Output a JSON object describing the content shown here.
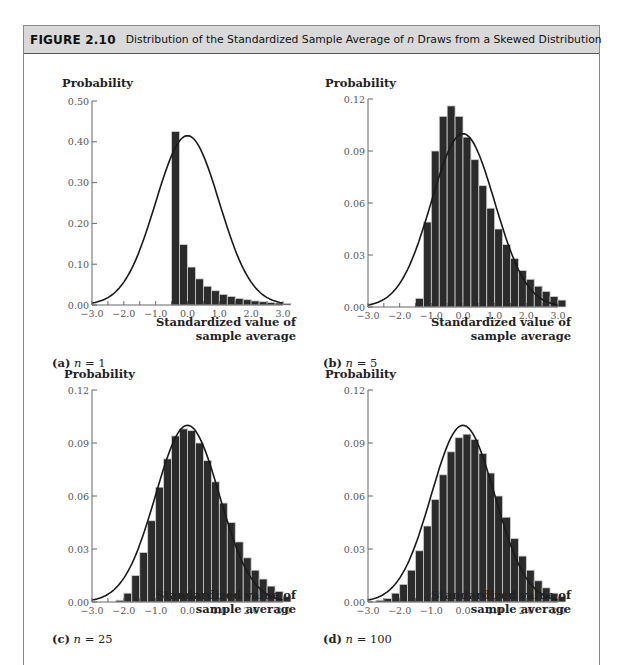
{
  "figure": {
    "number": "FIGURE 2.10",
    "title_pre": "Distribution of the Standardized Sample Average of ",
    "title_var": "n",
    "title_post": " Draws from a Skewed Distribution"
  },
  "colors": {
    "header_bg": "#d9d9d9",
    "bar": "#2b2b2b",
    "bar_edge": "#cfcfcf",
    "curve": "#1a1a1a",
    "axis": "#666666"
  },
  "chart_data": [
    {
      "id": "a",
      "type": "bar",
      "title": "(a) n = 1",
      "caption_letter": "(a)",
      "caption_var": "n",
      "caption_value": "= 1",
      "xlabel": "Standardized value of sample average",
      "xlabel_line1": "Standardized value of",
      "xlabel_line2": "sample average",
      "ylabel": "Probability",
      "xlim": [
        -3.0,
        3.0
      ],
      "ylim": [
        0.0,
        0.5
      ],
      "xticks": [
        "-3.0",
        "-2.0",
        "-1.0",
        "0.0",
        "1.0",
        "2.0",
        "3.0"
      ],
      "yticks": [
        "0.00",
        "0.10",
        "0.20",
        "0.30",
        "0.40",
        "0.50"
      ],
      "ytick_values": [
        0.0,
        0.1,
        0.2,
        0.3,
        0.4,
        0.5
      ],
      "bin_width": 0.25,
      "bin_start": -0.5,
      "values": [
        0.425,
        0.148,
        0.093,
        0.064,
        0.046,
        0.035,
        0.026,
        0.021,
        0.016,
        0.013,
        0.01,
        0.008,
        0.006,
        0.005,
        0.004
      ],
      "overlay": {
        "type": "normal-density",
        "peak": 0.415,
        "mean": 0.0,
        "sd": 1.0
      }
    },
    {
      "id": "b",
      "type": "bar",
      "title": "(b) n = 5",
      "caption_letter": "(b)",
      "caption_var": "n",
      "caption_value": "= 5",
      "xlabel": "Standardized value of sample average",
      "xlabel_line1": "Standardized value of",
      "xlabel_line2": "sample average",
      "ylabel": "Probability",
      "xlim": [
        -3.0,
        3.0
      ],
      "ylim": [
        0.0,
        0.12
      ],
      "xticks": [
        "-3.0",
        "-2.0",
        "-1.0",
        "0.0",
        "1.0",
        "2.0",
        "3.0"
      ],
      "yticks": [
        "0.00",
        "0.03",
        "0.06",
        "0.09",
        "0.12"
      ],
      "ytick_values": [
        0.0,
        0.03,
        0.06,
        0.09,
        0.12
      ],
      "bin_width": 0.25,
      "bin_start": -1.5,
      "values": [
        0.005,
        0.049,
        0.09,
        0.11,
        0.116,
        0.11,
        0.098,
        0.085,
        0.07,
        0.057,
        0.045,
        0.036,
        0.028,
        0.021,
        0.016,
        0.012,
        0.009,
        0.006,
        0.004
      ],
      "overlay": {
        "type": "normal-density",
        "peak": 0.1,
        "mean": 0.0,
        "sd": 1.0
      }
    },
    {
      "id": "c",
      "type": "bar",
      "title": "(c) n = 25",
      "caption_letter": "(c)",
      "caption_var": "n",
      "caption_value": "= 25",
      "xlabel": "Standardized value of sample average",
      "xlabel_line1": "Standardized value of",
      "xlabel_line2": "sample average",
      "ylabel": "Probability",
      "xlim": [
        -3.0,
        3.0
      ],
      "ylim": [
        0.0,
        0.12
      ],
      "xticks": [
        "-3.0",
        "-2.0",
        "-1.0",
        "0.0",
        "1.0",
        "2.0",
        "3.0"
      ],
      "yticks": [
        "0.00",
        "0.03",
        "0.06",
        "0.09",
        "0.12"
      ],
      "ytick_values": [
        0.0,
        0.03,
        0.06,
        0.09,
        0.12
      ],
      "bin_width": 0.25,
      "bin_start": -2.25,
      "values": [
        0.001,
        0.005,
        0.015,
        0.028,
        0.046,
        0.065,
        0.081,
        0.094,
        0.098,
        0.097,
        0.09,
        0.08,
        0.068,
        0.056,
        0.045,
        0.034,
        0.025,
        0.018,
        0.013,
        0.009,
        0.006,
        0.003
      ],
      "overlay": {
        "type": "normal-density",
        "peak": 0.1,
        "mean": 0.0,
        "sd": 1.0
      }
    },
    {
      "id": "d",
      "type": "bar",
      "title": "(d) n = 100",
      "caption_letter": "(d)",
      "caption_var": "n",
      "caption_value": "= 100",
      "xlabel": "Standardized value of sample average",
      "xlabel_line1": "Standardized value of",
      "xlabel_line2": "sample average",
      "ylabel": "Probability",
      "xlim": [
        -3.0,
        3.0
      ],
      "ylim": [
        0.0,
        0.12
      ],
      "xticks": [
        "-3.0",
        "-2.0",
        "-1.0",
        "0.0",
        "1.0",
        "2.0",
        "3.0"
      ],
      "yticks": [
        "0.00",
        "0.03",
        "0.06",
        "0.09",
        "0.12"
      ],
      "ytick_values": [
        0.0,
        0.03,
        0.06,
        0.09,
        0.12
      ],
      "bin_width": 0.25,
      "bin_start": -2.75,
      "values": [
        0.001,
        0.002,
        0.005,
        0.01,
        0.018,
        0.029,
        0.043,
        0.058,
        0.072,
        0.085,
        0.093,
        0.095,
        0.092,
        0.084,
        0.073,
        0.06,
        0.048,
        0.036,
        0.026,
        0.018,
        0.012,
        0.008,
        0.005,
        0.003
      ],
      "overlay": {
        "type": "normal-density",
        "peak": 0.1,
        "mean": 0.0,
        "sd": 1.0
      }
    }
  ]
}
